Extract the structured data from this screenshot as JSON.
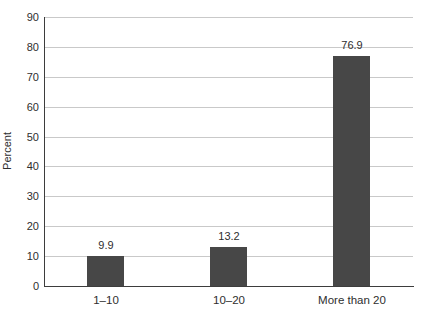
{
  "chart_data": {
    "type": "bar",
    "title": "",
    "categories": [
      "1–10",
      "10–20",
      "More than 20"
    ],
    "values": [
      9.9,
      13.2,
      76.9
    ],
    "value_labels": [
      "9.9",
      "13.2",
      "76.9"
    ],
    "xlabel": "",
    "ylabel": "Percent",
    "ylim": [
      0,
      90
    ],
    "yticks": [
      0,
      10,
      20,
      30,
      40,
      50,
      60,
      70,
      80,
      90
    ],
    "grid": "horizontal-gridlines-behind-bars",
    "legend": "none",
    "colors": {
      "bar": "#474747",
      "gridline": "#c9c9c9",
      "axis": "#3d3d3d",
      "text": "#2e2e2e",
      "background": "#ffffff"
    }
  }
}
